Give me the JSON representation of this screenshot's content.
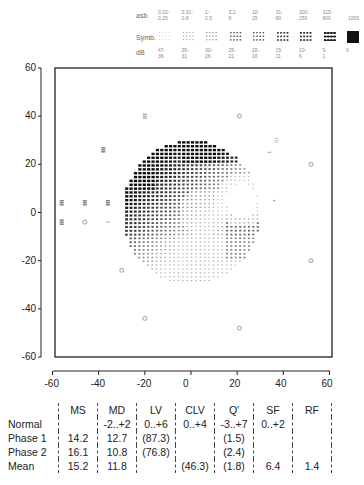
{
  "legend": {
    "row_labels": {
      "asb": "asb",
      "symb": "Symb.",
      "db": "dB"
    },
    "asb": [
      "0.02-\n0.25",
      "0.31-\n0.8",
      "1-\n2.5",
      "3.1-\n8",
      "10-\n25",
      "31-\n80",
      "100-\n250",
      "315-\n800",
      "1000"
    ],
    "db": [
      "47-\n36",
      "35-\n31",
      "30-\n26",
      "25-\n21",
      "20-\n16",
      "15-\n11",
      "10-\n6",
      "5-\n1",
      "0"
    ],
    "symbol_levels": [
      0.15,
      0.3,
      0.4,
      0.6,
      0.6,
      0.75,
      0.8,
      0.9,
      1.0
    ]
  },
  "chart_data": {
    "type": "heatmap",
    "xlabel": "",
    "ylabel": "",
    "xlim": [
      -60,
      60
    ],
    "ylim": [
      -60,
      60
    ],
    "x_ticks": [
      -60,
      -40,
      -20,
      0,
      20,
      40,
      60
    ],
    "y_ticks": [
      60,
      40,
      20,
      0,
      -20,
      -40,
      -60
    ],
    "field": {
      "center": [
        0,
        0
      ],
      "radius": 30,
      "dense_defect_region": "upper-left quadrant",
      "blank_region_center": [
        22,
        5
      ]
    },
    "peripheral_points": [
      {
        "x": -56,
        "y": 4,
        "mark": "dense"
      },
      {
        "x": -46,
        "y": 4,
        "mark": "dense"
      },
      {
        "x": -36,
        "y": 4,
        "mark": "dense"
      },
      {
        "x": -56,
        "y": -4,
        "mark": "dense"
      },
      {
        "x": -46,
        "y": -4,
        "mark": "circle"
      },
      {
        "x": -36,
        "y": -4,
        "mark": "dash"
      },
      {
        "x": -38,
        "y": 26,
        "mark": "dense"
      },
      {
        "x": -20,
        "y": 40,
        "mark": "medium"
      },
      {
        "x": 21,
        "y": 40,
        "mark": "circle"
      },
      {
        "x": 52,
        "y": 20,
        "mark": "circle"
      },
      {
        "x": 52,
        "y": -20,
        "mark": "circle"
      },
      {
        "x": -30,
        "y": -24,
        "mark": "circle"
      },
      {
        "x": -20,
        "y": -44,
        "mark": "circle"
      },
      {
        "x": 21,
        "y": -48,
        "mark": "circle"
      },
      {
        "x": 37,
        "y": 30,
        "mark": "light"
      },
      {
        "x": 34,
        "y": 25,
        "mark": "dash"
      },
      {
        "x": 36,
        "y": 5,
        "mark": "dot"
      }
    ]
  },
  "stats": {
    "headers": [
      "",
      "MS",
      "MD",
      "LV",
      "CLV",
      "Q'",
      "SF",
      "RF"
    ],
    "rows": [
      {
        "label": "Normal",
        "values": [
          "",
          "-2..+2",
          "0..+6",
          "0..+4",
          "-3..+7",
          "0..+2",
          ""
        ]
      },
      {
        "label": "Phase 1",
        "values": [
          "14.2",
          "12.7",
          "(87.3)",
          "",
          "(1.5)",
          "",
          ""
        ]
      },
      {
        "label": "Phase 2",
        "values": [
          "16.1",
          "10.8",
          "(76.8)",
          "",
          "(2.4)",
          "",
          ""
        ]
      },
      {
        "label": "Mean",
        "values": [
          "15.2",
          "11.8",
          "",
          "(46.3)",
          "(1.8)",
          "6.4",
          "1.4"
        ]
      }
    ]
  }
}
